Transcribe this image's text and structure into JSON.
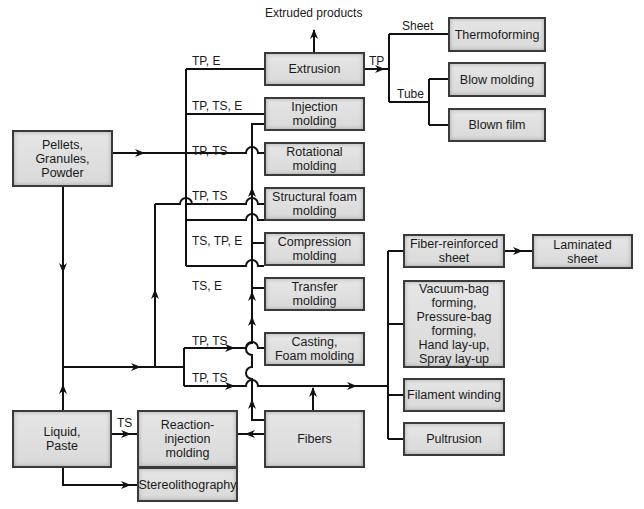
{
  "diagram": {
    "type": "process-flowchart",
    "nodes": {
      "pellets": "Pellets,\nGranules,\nPowder",
      "liquid": "Liquid,\nPaste",
      "extrusion": "Extrusion",
      "injection": "Injection\nmolding",
      "rotational": "Rotational\nmolding",
      "structural_foam": "Structural foam\nmolding",
      "compression": "Compression\nmolding",
      "transfer": "Transfer\nmolding",
      "casting": "Casting,\nFoam molding",
      "fibers": "Fibers",
      "reaction_injection": "Reaction-\ninjection\nmolding",
      "stereolithography": "Stereolithography",
      "thermoforming": "Thermoforming",
      "blow_molding": "Blow molding",
      "blown_film": "Blown film",
      "fiber_reinforced_sheet": "Fiber-reinforced\nsheet",
      "laminated_sheet": "Laminated\nsheet",
      "bag_forming": "Vacuum-bag\nforming,\nPressure-bag\nforming,\nHand lay-up,\nSpray lay-up",
      "filament_winding": "Filament winding",
      "pultrusion": "Pultrusion"
    },
    "labels": {
      "extruded_products": "Extruded products",
      "extrusion_in": "TP, E",
      "injection_in": "TP, TS, E",
      "rotational_in": "TP, TS",
      "structural_in": "TP, TS",
      "compression_in": "TS, TP, E",
      "transfer_in": "TS, E",
      "casting_in": "TP, TS",
      "composite_in": "TP, TS",
      "reaction_in": "TS",
      "extrusion_out": "TP",
      "sheet": "Sheet",
      "tube": "Tube"
    },
    "edges": [
      {
        "from": "pellets",
        "to": "extrusion",
        "label": "TP, E"
      },
      {
        "from": "pellets",
        "to": "injection",
        "label": "TP, TS, E"
      },
      {
        "from": "pellets",
        "to": "rotational",
        "label": "TP, TS"
      },
      {
        "from": "pellets",
        "to": "structural_foam",
        "label": "TP, TS"
      },
      {
        "from": "pellets",
        "to": "compression",
        "label": "TS, TP, E"
      },
      {
        "from": "pellets",
        "to": "transfer",
        "label": "TS, E"
      },
      {
        "from": "pellets",
        "to": "liquid"
      },
      {
        "from": "liquid",
        "to": "casting",
        "label": "TP, TS"
      },
      {
        "from": "liquid",
        "to": "composites",
        "label": "TP, TS"
      },
      {
        "from": "liquid",
        "to": "structural_foam"
      },
      {
        "from": "liquid",
        "to": "reaction_injection",
        "label": "TS"
      },
      {
        "from": "liquid",
        "to": "stereolithography"
      },
      {
        "from": "fibers",
        "to": "reaction_injection"
      },
      {
        "from": "fibers",
        "to": "injection"
      },
      {
        "from": "fibers",
        "to": "composites"
      },
      {
        "from": "extrusion",
        "to": "extruded_products"
      },
      {
        "from": "extrusion",
        "to": "thermoforming",
        "label": "Sheet"
      },
      {
        "from": "extrusion",
        "to": "blow_molding",
        "label": "Tube"
      },
      {
        "from": "extrusion",
        "to": "blown_film",
        "label": "Tube"
      },
      {
        "from": "composites",
        "to": "fiber_reinforced_sheet"
      },
      {
        "from": "composites",
        "to": "bag_forming"
      },
      {
        "from": "composites",
        "to": "filament_winding"
      },
      {
        "from": "composites",
        "to": "pultrusion"
      },
      {
        "from": "fiber_reinforced_sheet",
        "to": "laminated_sheet"
      }
    ],
    "colors": {
      "box_fill": "#dedede",
      "box_border": "#3a3a3a",
      "line": "#111111"
    }
  }
}
